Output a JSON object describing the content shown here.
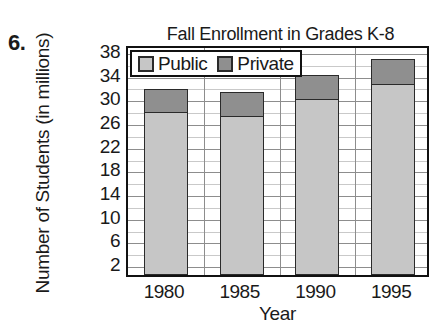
{
  "problem": {
    "number": "6."
  },
  "chart_data": {
    "type": "bar",
    "subtype": "stacked-vertical",
    "title": "Fall Enrollment in Grades K-8",
    "xlabel": "Year",
    "ylabel": "Number of Students (in millions)",
    "categories": [
      "1980",
      "1985",
      "1990",
      "1995"
    ],
    "series": [
      {
        "name": "Public",
        "color": "#c6c6c6",
        "values": [
          27.6,
          27.0,
          29.8,
          32.3
        ]
      },
      {
        "name": "Private",
        "color": "#8f8f8f",
        "values": [
          4.1,
          4.1,
          4.2,
          4.5
        ]
      }
    ],
    "totals": [
      31.7,
      31.1,
      34.0,
      36.8
    ],
    "ylim": [
      0,
      39
    ],
    "yticks": [
      38,
      34,
      30,
      26,
      22,
      18,
      14,
      10,
      6,
      2
    ],
    "ytick_labels": [
      "38",
      "34",
      "30",
      "26",
      "22",
      "18",
      "14",
      "10",
      "6",
      "2"
    ],
    "minor_gridlines": true,
    "minor_tick_step": 2,
    "grid": true,
    "legend_position": "top-left-inside"
  },
  "legend": {
    "entries": [
      {
        "label": "Public",
        "swatch": "public-swatch"
      },
      {
        "label": "Private",
        "swatch": "private-swatch"
      }
    ]
  }
}
